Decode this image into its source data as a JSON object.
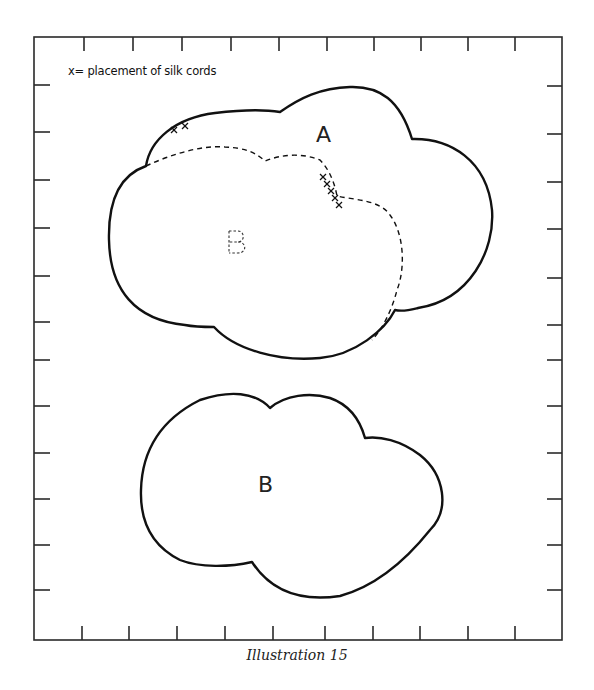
{
  "legend": {
    "text": "x= placement of silk cords",
    "marker": "x"
  },
  "pieces": [
    {
      "id": "A",
      "label": "A",
      "style": "solid outline",
      "description": "upper cloud piece A"
    },
    {
      "id": "B-overlay",
      "label": "B",
      "style": "dashed outline overlaid on A"
    },
    {
      "id": "B",
      "label": "B",
      "style": "solid outline",
      "description": "separate lower cloud piece B"
    }
  ],
  "cord_marks": {
    "top_left_count": 2,
    "right_notch_count": 5
  },
  "frame": {
    "ticks_top": 10,
    "ticks_bottom": 10,
    "ticks_left": 12,
    "ticks_right": 12
  },
  "caption": "Illustration 15",
  "colors": {
    "line": "#111111",
    "background": "#ffffff"
  }
}
